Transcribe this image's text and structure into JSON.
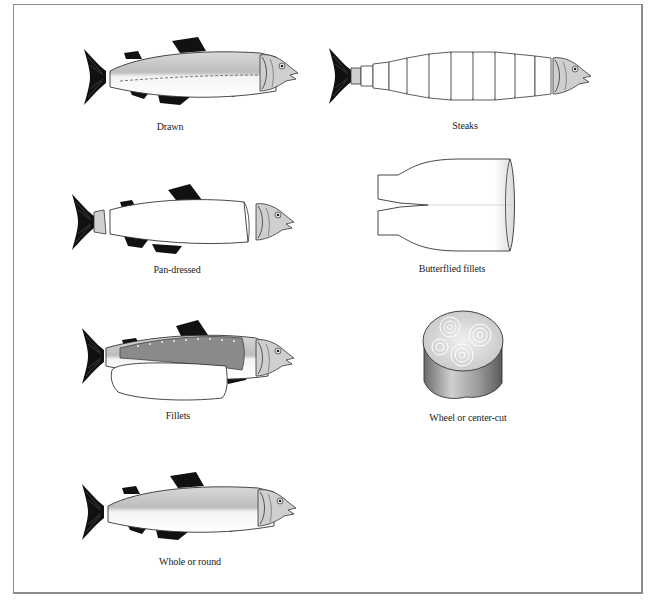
{
  "diagram": {
    "colors": {
      "frame": "#8c8c8c",
      "fin": "#111111",
      "body_shade": "#c8c8c8",
      "outline": "#333333",
      "fillet_dark": "#8a8a8a",
      "label": "#222222"
    },
    "panels": [
      {
        "id": "drawn",
        "label": "Drawn",
        "icon": "whole-fish-dashed-belly"
      },
      {
        "id": "steaks",
        "label": "Steaks",
        "icon": "fish-cut-into-steaks"
      },
      {
        "id": "pan-dressed",
        "label": "Pan-dressed",
        "icon": "fish-head-and-tail-separated"
      },
      {
        "id": "butterflied-fillets",
        "label": "Butterflied fillets",
        "icon": "butterflied-fillet-shape"
      },
      {
        "id": "fillets",
        "label": "Fillets",
        "icon": "fish-with-fillet-removed"
      },
      {
        "id": "wheel",
        "label": "Wheel or center-cut",
        "icon": "cylindrical-wheel-cut"
      },
      {
        "id": "whole",
        "label": "Whole or round",
        "icon": "whole-fish"
      }
    ]
  }
}
